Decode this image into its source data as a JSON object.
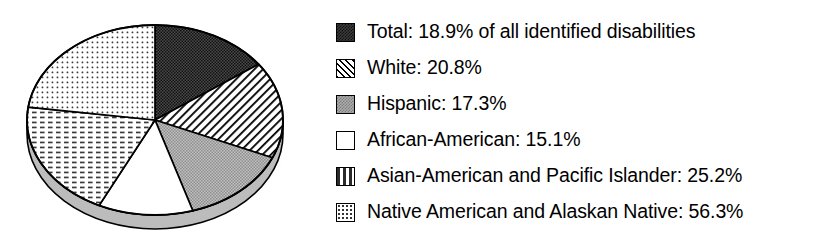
{
  "chart_data": {
    "type": "pie",
    "title": "",
    "subtitle": "",
    "xlabel": "",
    "ylabel": "",
    "legend_position": "right",
    "three_d": true,
    "note": "Percentages are independent rates per group, not parts of a whole; pie wedge sizes are proportional to the listed percentages.",
    "categories": [
      "Total",
      "White",
      "Hispanic",
      "African-American",
      "Asian-American and Pacific Islander",
      "Native American and Alaskan Native"
    ],
    "values": [
      18.9,
      20.8,
      17.3,
      15.1,
      25.2,
      56.3
    ],
    "value_suffix": "%",
    "slices": [
      {
        "name": "Total",
        "legend_text": "Total: 18.9% of all identified disabilities",
        "value": 18.9,
        "value_text": "18.9%",
        "pattern": "dark-checker",
        "color": "#3b3b3b",
        "start_angle_deg": 0,
        "end_angle_deg": 54.0
      },
      {
        "name": "White",
        "legend_text": "White: 20.8%",
        "value": 20.8,
        "value_text": "20.8%",
        "pattern": "diagonal-hatch",
        "color": "#ffffff",
        "start_angle_deg": 54.0,
        "end_angle_deg": 113.4
      },
      {
        "name": "Hispanic",
        "legend_text": "Hispanic: 17.3%",
        "value": 17.3,
        "value_text": "17.3%",
        "pattern": "gray-checker",
        "color": "#ababab",
        "start_angle_deg": 113.4,
        "end_angle_deg": 162.8
      },
      {
        "name": "African-American",
        "legend_text": "African-American: 15.1%",
        "value": 15.1,
        "value_text": "15.1%",
        "pattern": "solid-white",
        "color": "#ffffff",
        "start_angle_deg": 162.8,
        "end_angle_deg": 205.9
      },
      {
        "name": "Asian-American and Pacific Islander",
        "legend_text": "Asian-American and Pacific Islander: 25.2%",
        "value": 25.2,
        "value_text": "25.2%",
        "pattern": "dashes",
        "color": "#ffffff",
        "start_angle_deg": 205.9,
        "end_angle_deg": 277.8
      },
      {
        "name": "Native American and Alaskan Native",
        "legend_text": "Native American and Alaskan Native: 56.3%",
        "value": 56.3,
        "value_text": "56.3%",
        "pattern": "fine-dots",
        "color": "#ffffff",
        "start_angle_deg": 277.8,
        "end_angle_deg": 360.0
      }
    ]
  },
  "legend": {
    "items": [
      {
        "label": "Total: 18.9% of all identified disabilities",
        "swatch": "dark-checker"
      },
      {
        "label": "White: 20.8%",
        "swatch": "diagonal-hatch"
      },
      {
        "label": "Hispanic: 17.3%",
        "swatch": "gray-checker"
      },
      {
        "label": "African-American: 15.1%",
        "swatch": "solid-white"
      },
      {
        "label": "Asian-American and Pacific Islander: 25.2%",
        "swatch": "dashes"
      },
      {
        "label": "Native American and Alaskan Native: 56.3%",
        "swatch": "fine-dots"
      }
    ]
  },
  "colors": {
    "outline": "#000000",
    "dark_slice": "#3b3b3b",
    "gray_slice": "#ababab",
    "white_slice": "#ffffff",
    "background": "#ffffff",
    "side_wall": "#b9b9b9",
    "shadow": "#d8d8d8"
  }
}
